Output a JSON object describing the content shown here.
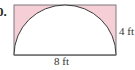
{
  "problem": {
    "number": "0."
  },
  "figure": {
    "shape": "rectangle with inscribed semicircle",
    "shaded_region": "rectangle minus semicircle",
    "shade_color": "#f6cfd6",
    "line_color": "#555555",
    "width_label": "8 ft",
    "height_label": "4 ft"
  }
}
